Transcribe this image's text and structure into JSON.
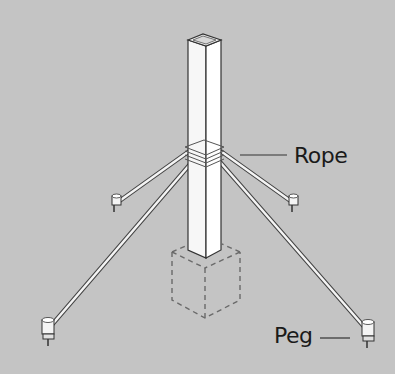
{
  "diagram": {
    "background_color": "#c4c4c4",
    "labels": {
      "rope": "Rope",
      "peg": "Peg"
    },
    "parts": [
      "post",
      "rope-binding",
      "guy-ropes",
      "pegs",
      "buried-footing"
    ]
  }
}
